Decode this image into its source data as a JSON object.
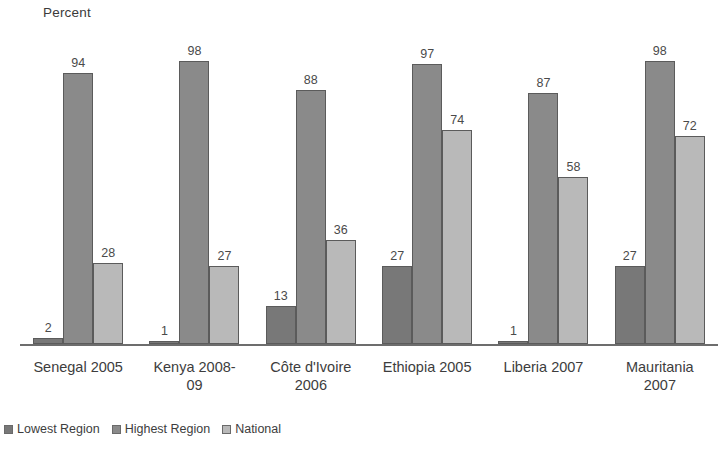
{
  "chart_data": {
    "type": "bar",
    "title": "",
    "subtitle": "",
    "xlabel": "",
    "ylabel": "Percent",
    "ylim": [
      0,
      100
    ],
    "grid": false,
    "legend_position": "bottom-left",
    "value_labels": true,
    "categories": [
      "Senegal 2005",
      "Kenya 2008-09",
      "Côte d'Ivoire 2006",
      "Ethiopia 2005",
      "Liberia 2007",
      "Mauritania 2007"
    ],
    "series": [
      {
        "name": "Lowest Region",
        "color": "#787878",
        "values": [
          2,
          1,
          13,
          27,
          1,
          27
        ]
      },
      {
        "name": "Highest Region",
        "color": "#8a8a8a",
        "values": [
          94,
          98,
          88,
          97,
          87,
          98
        ]
      },
      {
        "name": "National",
        "color": "#b9b9b9",
        "values": [
          28,
          27,
          36,
          74,
          58,
          72
        ]
      }
    ]
  },
  "axis": {
    "y_title": "Percent"
  },
  "category_lines": [
    [
      "Senegal 2005"
    ],
    [
      "Kenya 2008-",
      "09"
    ],
    [
      "Côte d'Ivoire",
      "2006"
    ],
    [
      "Ethiopia 2005"
    ],
    [
      "Liberia 2007"
    ],
    [
      "Mauritania",
      "2007"
    ]
  ],
  "legend": {
    "items": [
      {
        "label": "Lowest Region"
      },
      {
        "label": "Highest Region"
      },
      {
        "label": "National"
      }
    ]
  }
}
